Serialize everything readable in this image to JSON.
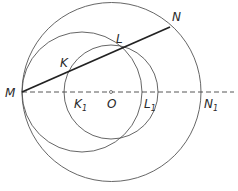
{
  "diagram": {
    "type": "geometry",
    "points": {
      "M": {
        "label": "M",
        "x": 22,
        "y": 92
      },
      "N": {
        "label": "N",
        "x": 170,
        "y": 27
      },
      "K": {
        "label": "K",
        "x": 68,
        "y": 71
      },
      "L": {
        "label": "L",
        "x": 121,
        "y": 48
      },
      "O": {
        "label": "O",
        "x": 111,
        "y": 92
      },
      "K1": {
        "label": "K",
        "sub": "1",
        "x": 64,
        "y": 92
      },
      "L1": {
        "label": "L",
        "sub": "1",
        "x": 142,
        "y": 92
      },
      "N1": {
        "label": "N",
        "sub": "1",
        "x": 201,
        "y": 92
      }
    },
    "circles": [
      {
        "name": "outer-circle",
        "cx": 111.5,
        "cy": 92,
        "r": 89.5
      },
      {
        "name": "middle-circle",
        "cx": 82,
        "cy": 92,
        "r": 60
      },
      {
        "name": "inner-circle",
        "cx": 111,
        "cy": 92,
        "r": 47
      }
    ],
    "colors": {
      "line": "#333333",
      "circle": "#555555"
    }
  }
}
